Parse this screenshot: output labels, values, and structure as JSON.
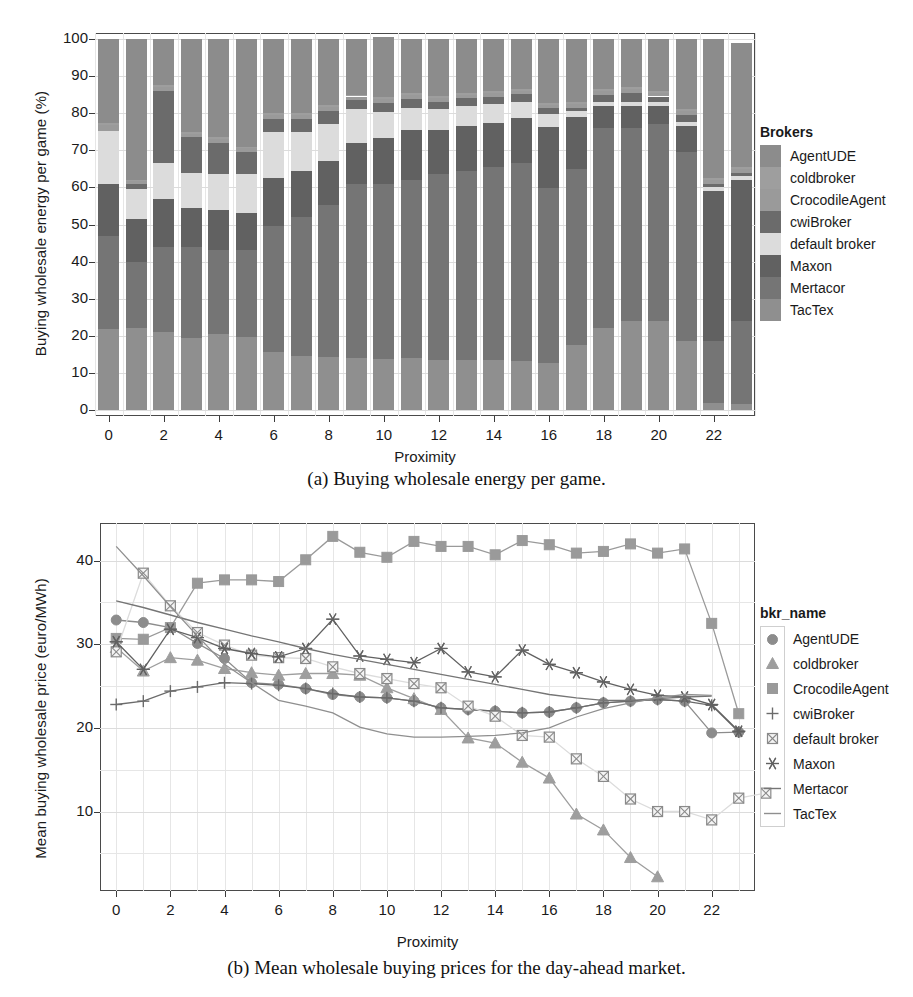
{
  "figure_a": {
    "caption": "(a) Buying wholesale energy per game.",
    "legend_title": "Brokers",
    "axis": {
      "ylabel": "Buying wholesale energy per game (%)",
      "xlabel": "Proximity"
    },
    "yticks": [
      "100",
      "90",
      "80",
      "70",
      "60",
      "50",
      "40",
      "30",
      "20",
      "10",
      "0"
    ],
    "xticks": [
      "0",
      "2",
      "4",
      "6",
      "8",
      "10",
      "12",
      "14",
      "16",
      "18",
      "20",
      "22"
    ]
  },
  "figure_b": {
    "caption": "(b) Mean wholesale buying prices for the day-ahead market.",
    "legend_title": "bkr_name",
    "axis": {
      "ylabel": "Mean buying wholesale price (euro/MWh)",
      "xlabel": "Proximity"
    },
    "yticks": [
      "40",
      "30",
      "20",
      "10"
    ],
    "xticks": [
      "0",
      "2",
      "4",
      "6",
      "8",
      "10",
      "12",
      "14",
      "16",
      "18",
      "20",
      "22"
    ]
  },
  "brokers": [
    {
      "name": "AgentUDE",
      "color": "#8c8c8c",
      "marker": "circle"
    },
    {
      "name": "coldbroker",
      "color": "#9e9e9e",
      "marker": "triangle"
    },
    {
      "name": "CrocodileAgent",
      "color": "#9a9a9a",
      "marker": "square"
    },
    {
      "name": "cwiBroker",
      "color": "#6b6b6b",
      "marker": "plus"
    },
    {
      "name": "default broker",
      "color": "#dcdcdc",
      "marker": "square-x"
    },
    {
      "name": "Maxon",
      "color": "#616161",
      "marker": "asterisk"
    },
    {
      "name": "Mertacor",
      "color": "#757575",
      "marker": "line"
    },
    {
      "name": "TacTex",
      "color": "#8f8f8f",
      "marker": "line"
    }
  ],
  "chart_data": [
    {
      "type": "bar",
      "stacked": true,
      "percent": true,
      "title": "(a) Buying wholesale energy per game.",
      "xlabel": "Proximity",
      "ylabel": "Buying wholesale energy per game (%)",
      "ylim": [
        0,
        100
      ],
      "xlim": [
        0,
        23
      ],
      "grid": true,
      "legend_position": "right",
      "legend_title": "Brokers",
      "categories": [
        0,
        1,
        2,
        3,
        4,
        5,
        6,
        7,
        8,
        9,
        10,
        11,
        12,
        13,
        14,
        15,
        16,
        17,
        18,
        19,
        20,
        21,
        22,
        23
      ],
      "series": [
        {
          "name": "TacTex",
          "color": "#8f8f8f",
          "values": [
            21.8,
            22.0,
            21.0,
            19.5,
            20.5,
            19.8,
            15.5,
            14.5,
            14.2,
            14.0,
            13.8,
            13.9,
            13.6,
            13.5,
            13.4,
            13.1,
            12.8,
            17.5,
            22.0,
            24.0,
            24.0,
            18.5,
            2.0,
            1.5
          ]
        },
        {
          "name": "Mertacor",
          "color": "#757575",
          "values": [
            25.0,
            17.8,
            23.0,
            24.5,
            22.5,
            23.2,
            34.0,
            37.5,
            41.0,
            47.0,
            47.0,
            48.0,
            50.0,
            51.0,
            52.0,
            53.5,
            47.0,
            47.5,
            54.0,
            52.0,
            53.0,
            51.0,
            16.5,
            22.5
          ]
        },
        {
          "name": "Maxon",
          "color": "#616161",
          "values": [
            14.0,
            11.8,
            13.0,
            10.5,
            11.0,
            10.0,
            13.0,
            12.5,
            12.0,
            11.0,
            12.5,
            13.5,
            12.0,
            12.0,
            12.0,
            12.0,
            16.5,
            14.0,
            6.0,
            6.0,
            5.0,
            7.0,
            40.5,
            38.0
          ]
        },
        {
          "name": "default broker",
          "color": "#dcdcdc",
          "values": [
            14.5,
            8.0,
            9.5,
            9.5,
            9.5,
            10.5,
            12.5,
            10.5,
            10.0,
            9.0,
            7.0,
            6.0,
            5.5,
            5.5,
            5.0,
            4.5,
            3.5,
            1.5,
            1.0,
            1.0,
            1.0,
            1.0,
            1.0,
            1.0
          ]
        },
        {
          "name": "cwiBroker",
          "color": "#6b6b6b",
          "values": [
            0.0,
            1.3,
            19.5,
            9.5,
            8.5,
            6.0,
            3.5,
            3.5,
            3.5,
            2.5,
            2.5,
            2.5,
            2.0,
            2.0,
            2.0,
            2.0,
            1.5,
            1.0,
            2.0,
            2.5,
            1.5,
            2.0,
            1.0,
            1.0
          ]
        },
        {
          "name": "CrocodileAgent",
          "color": "#9a9a9a",
          "values": [
            1.5,
            0.8,
            1.0,
            1.0,
            1.0,
            1.0,
            1.0,
            1.0,
            1.0,
            1.0,
            1.0,
            1.0,
            1.0,
            1.0,
            1.0,
            1.0,
            1.0,
            1.0,
            1.0,
            1.0,
            1.0,
            1.0,
            1.0,
            1.0
          ]
        },
        {
          "name": "coldbroker",
          "color": "#9e9e9e",
          "values": [
            0.5,
            0.3,
            0.5,
            0.5,
            0.5,
            0.5,
            0.5,
            0.5,
            0.5,
            0.5,
            0.5,
            0.5,
            0.5,
            0.5,
            0.5,
            0.5,
            0.5,
            0.5,
            0.5,
            0.5,
            0.5,
            0.5,
            0.5,
            0.5
          ]
        },
        {
          "name": "AgentUDE",
          "color": "#8c8c8c",
          "values": [
            22.7,
            38.0,
            12.5,
            25.0,
            26.5,
            29.0,
            20.0,
            20.0,
            17.8,
            15.0,
            16.2,
            14.6,
            15.4,
            14.5,
            14.1,
            13.4,
            17.2,
            17.0,
            13.5,
            13.0,
            14.0,
            19.0,
            37.5,
            33.5
          ]
        }
      ]
    },
    {
      "type": "line",
      "title": "(b) Mean wholesale buying prices for the day-ahead market.",
      "xlabel": "Proximity",
      "ylabel": "Mean buying wholesale price (euro/MWh)",
      "ylim": [
        0,
        45
      ],
      "xlim": [
        0,
        23
      ],
      "grid": true,
      "legend_position": "right",
      "legend_title": "bkr_name",
      "x": [
        0,
        1,
        2,
        3,
        4,
        5,
        6,
        7,
        8,
        9,
        10,
        11,
        12,
        13,
        14,
        15,
        16,
        17,
        18,
        19,
        20,
        21,
        22,
        23
      ],
      "series": [
        {
          "name": "AgentUDE",
          "color": "#8c8c8c",
          "marker": "circle",
          "values": [
            32.9,
            32.6,
            32.0,
            30.1,
            28.3,
            25.4,
            25.2,
            24.7,
            24.0,
            23.7,
            23.6,
            23.2,
            22.4,
            22.2,
            22.0,
            21.8,
            21.9,
            22.4,
            23.0,
            23.2,
            23.4,
            23.2,
            19.4,
            19.5
          ]
        },
        {
          "name": "coldbroker",
          "color": "#9e9e9e",
          "marker": "triangle",
          "values": [
            29.6,
            26.8,
            28.4,
            28.1,
            27.1,
            26.6,
            26.3,
            26.5,
            26.5,
            26.3,
            24.8,
            23.5,
            22.2,
            18.8,
            18.2,
            15.9,
            14.0,
            9.7,
            7.8,
            4.5,
            2.2,
            null,
            null,
            null
          ]
        },
        {
          "name": "CrocodileAgent",
          "color": "#9a9a9a",
          "marker": "square",
          "values": [
            30.7,
            30.6,
            32.0,
            37.3,
            37.7,
            37.7,
            37.5,
            40.1,
            42.9,
            41.0,
            40.4,
            42.3,
            41.7,
            41.7,
            40.7,
            42.4,
            41.9,
            40.9,
            41.1,
            42.0,
            40.9,
            41.4,
            32.5,
            21.7
          ]
        },
        {
          "name": "cwiBroker",
          "color": "#6b6b6b",
          "marker": "plus",
          "values": [
            22.8,
            23.2,
            24.4,
            24.9,
            25.4,
            25.3,
            25.1,
            24.7,
            24.1,
            23.7,
            23.6,
            23.2,
            22.4,
            22.2,
            22.0,
            21.8,
            21.9,
            22.4,
            23.0,
            23.2,
            23.4,
            23.2,
            22.7,
            19.5
          ]
        },
        {
          "name": "default broker",
          "color": "#dcdcdc",
          "marker": "square-x",
          "values": [
            29.1,
            38.5,
            34.6,
            31.4,
            29.9,
            28.7,
            28.4,
            28.3,
            27.3,
            26.5,
            25.9,
            25.3,
            24.8,
            22.6,
            21.4,
            19.1,
            18.9,
            16.3,
            14.2,
            11.5,
            10.0,
            10.0,
            9.0,
            11.6,
            12.2
          ]
        },
        {
          "name": "Maxon",
          "color": "#616161",
          "marker": "asterisk",
          "values": [
            30.3,
            27.0,
            31.8,
            30.8,
            29.5,
            28.9,
            28.5,
            29.5,
            33.0,
            28.6,
            28.2,
            27.8,
            29.5,
            26.7,
            26.1,
            29.3,
            27.6,
            26.6,
            25.5,
            24.6,
            23.9,
            23.7,
            22.8,
            19.6
          ]
        },
        {
          "name": "Mertacor",
          "color": "#757575",
          "marker": "line",
          "values": [
            35.2,
            34.4,
            33.5,
            32.6,
            31.8,
            31.0,
            30.3,
            29.5,
            28.8,
            28.2,
            27.6,
            27.0,
            26.4,
            25.8,
            25.2,
            24.6,
            24.0,
            23.6,
            23.3,
            23.3,
            23.5,
            23.7,
            23.8,
            null
          ]
        },
        {
          "name": "TacTex",
          "color": "#8f8f8f",
          "marker": "line",
          "values": [
            41.7,
            38.2,
            34.5,
            31.0,
            27.6,
            25.4,
            23.3,
            22.6,
            21.8,
            20.1,
            19.3,
            18.9,
            18.9,
            19.0,
            19.1,
            19.4,
            20.0,
            21.3,
            22.3,
            23.0,
            23.6,
            24.0,
            23.9,
            null
          ]
        }
      ]
    }
  ]
}
